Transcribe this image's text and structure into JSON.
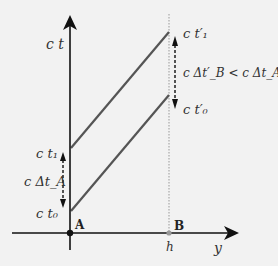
{
  "diagram": {
    "axes": {
      "vertical_label": "c t",
      "horizontal_label": "y"
    },
    "points": {
      "A": {
        "label": "A",
        "position": "origin"
      },
      "B": {
        "label": "B",
        "position_label": "h"
      }
    },
    "left_labels": {
      "ct1": "c t₁",
      "ct0": "c t₀",
      "interval": "c Δt_A"
    },
    "right_labels": {
      "ct1_prime": "c t′₁",
      "ct0_prime": "c t′₀",
      "relation": "c Δt′_B < c Δt_A"
    },
    "colors": {
      "background": "#f2f2f2",
      "axes": "#111111",
      "worldlines": "#555555",
      "dotted_line": "#999999",
      "text": "#333333"
    }
  }
}
